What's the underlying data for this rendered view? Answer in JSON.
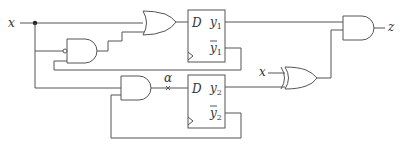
{
  "diagram": {
    "type": "sequential-logic-circuit",
    "input_label": "x",
    "xor_input_label": "x",
    "output_label": "z",
    "signal_marker_label": "α",
    "flip_flops": [
      {
        "name": "FF1",
        "input": "D",
        "q": "y",
        "q_sub": "1",
        "qbar": "y",
        "qbar_sub": "1"
      },
      {
        "name": "FF2",
        "input": "D",
        "q": "y",
        "q_sub": "2",
        "qbar": "y",
        "qbar_sub": "2"
      }
    ],
    "gates": [
      {
        "type": "NAND",
        "inputs": [
          "x (inverted)",
          "ȳ1"
        ]
      },
      {
        "type": "OR",
        "inputs": [
          "x",
          "NAND out"
        ],
        "output": "D1"
      },
      {
        "type": "AND",
        "inputs": [
          "x",
          "ȳ2"
        ],
        "output": "D2 (α)"
      },
      {
        "type": "XOR",
        "inputs": [
          "x",
          "y2"
        ]
      },
      {
        "type": "AND",
        "inputs": [
          "y1",
          "XOR out"
        ],
        "output": "z"
      }
    ]
  }
}
